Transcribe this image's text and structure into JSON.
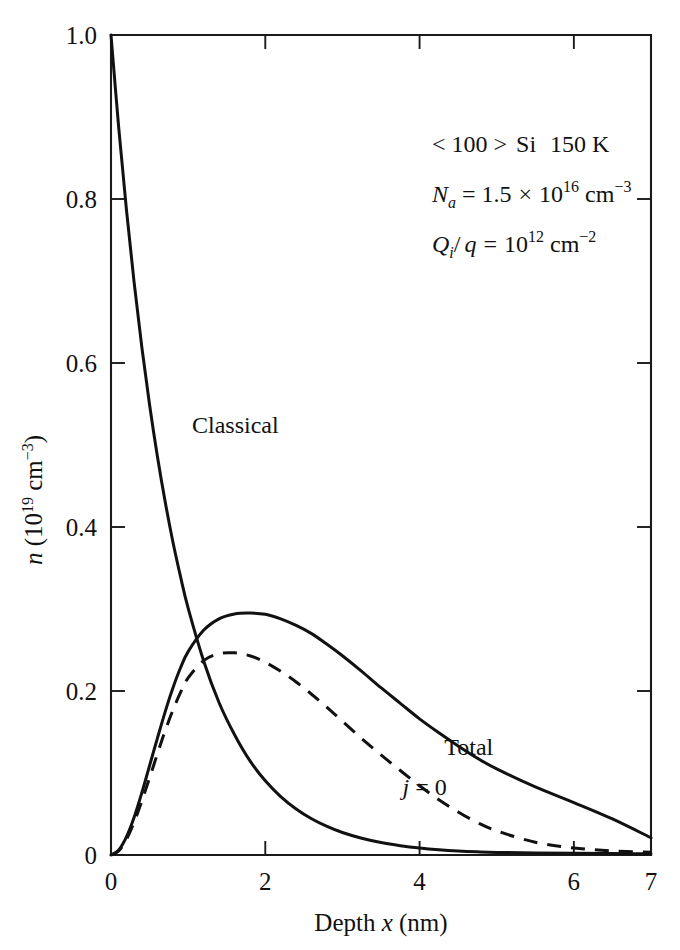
{
  "chart_data": {
    "type": "line",
    "title": "",
    "xlabel": "Depth x (nm)",
    "ylabel": "n (10^19 cm^-3)",
    "xlim": [
      0,
      7
    ],
    "ylim": [
      0,
      1.0
    ],
    "grid": false,
    "legend_position": "inline-curve-labels",
    "xticks": [
      0,
      2,
      4,
      6,
      7
    ],
    "xticklabels": [
      "0",
      "2",
      "4",
      "6",
      "7"
    ],
    "yticks": [
      0,
      0.2,
      0.4,
      0.6,
      0.8,
      1.0
    ],
    "yticklabels": [
      "0",
      "0.2",
      "0.4",
      "0.6",
      "0.8",
      "1.0"
    ],
    "x": [
      0,
      0.1,
      0.2,
      0.3,
      0.4,
      0.5,
      0.6,
      0.7,
      0.8,
      0.9,
      1.0,
      1.2,
      1.4,
      1.6,
      1.8,
      2.0,
      2.2,
      2.4,
      2.6,
      2.8,
      3.0,
      3.25,
      3.5,
      3.75,
      4.0,
      4.25,
      4.5,
      4.75,
      5.0,
      5.5,
      6.0,
      6.5,
      7.0
    ],
    "series": [
      {
        "name": "Classical",
        "style": "solid",
        "label": "Classical",
        "label_x": 1.05,
        "label_y": 0.515,
        "values": [
          1.0,
          0.887,
          0.787,
          0.698,
          0.619,
          0.549,
          0.487,
          0.432,
          0.383,
          0.34,
          0.301,
          0.237,
          0.186,
          0.147,
          0.115,
          0.0905,
          0.0713,
          0.0562,
          0.0442,
          0.0348,
          0.0274,
          0.0204,
          0.0152,
          0.0114,
          0.0085,
          0.0064,
          0.0049,
          0.0039,
          0.0032,
          0.0024,
          0.002,
          0.0017,
          0.0015
        ]
      },
      {
        "name": "Total",
        "style": "solid",
        "label": "Total",
        "label_x": 4.32,
        "label_y": 0.122,
        "values": [
          0.0,
          0.006,
          0.022,
          0.046,
          0.076,
          0.109,
          0.142,
          0.174,
          0.203,
          0.228,
          0.248,
          0.274,
          0.288,
          0.294,
          0.295,
          0.2935,
          0.288,
          0.28,
          0.27,
          0.257,
          0.243,
          0.224,
          0.204,
          0.185,
          0.166,
          0.149,
          0.133,
          0.118,
          0.105,
          0.083,
          0.064,
          0.044,
          0.021
        ]
      },
      {
        "name": "j = 0",
        "style": "dashed",
        "label": "j = 0",
        "label_x": 3.78,
        "label_y": 0.073,
        "values": [
          0.0,
          0.005,
          0.019,
          0.04,
          0.066,
          0.094,
          0.123,
          0.151,
          0.176,
          0.198,
          0.216,
          0.237,
          0.2455,
          0.2465,
          0.243,
          0.235,
          0.224,
          0.211,
          0.196,
          0.18,
          0.163,
          0.142,
          0.122,
          0.103,
          0.0845,
          0.0675,
          0.0525,
          0.0395,
          0.0295,
          0.0155,
          0.0085,
          0.005,
          0.0035
        ]
      }
    ],
    "annotations": [
      {
        "id": "material-line",
        "text": "< 100 > Si  150 K"
      },
      {
        "id": "acceptor-line",
        "text": "Na = 1.5 × 10^16 cm^-3"
      },
      {
        "id": "charge-line",
        "text": "Qi / q = 10^12 cm^-2"
      }
    ]
  },
  "annotation_parts": {
    "material": {
      "bracket_open": "< 100 >",
      "material": "Si",
      "temperature": "150 K"
    },
    "acceptor": {
      "symbol": "N",
      "sub": "a",
      "eq": "=",
      "mantissa": "1.5",
      "times": "×",
      "base": "10",
      "exponent": "16",
      "unit": "cm",
      "unit_exponent": "−3"
    },
    "charge": {
      "symbol": "Q",
      "sub": "i",
      "slash": "/",
      "denom": "q",
      "eq": "=",
      "base": "10",
      "exponent": "12",
      "unit": "cm",
      "unit_exponent": "−2"
    }
  },
  "axis_label_parts": {
    "x": {
      "prefix": "Depth ",
      "variable": "x",
      "unit": " (nm)"
    },
    "y": {
      "variable": "n",
      "open": " (10",
      "exponent": "19",
      "unit": " cm",
      "unit_exponent": "−3",
      "close": ")"
    }
  },
  "curve_label_parts": {
    "j_zero": {
      "variable": "j",
      "rest": " = 0"
    }
  },
  "colors": {
    "ink": "#111111",
    "background": "#ffffff"
  }
}
